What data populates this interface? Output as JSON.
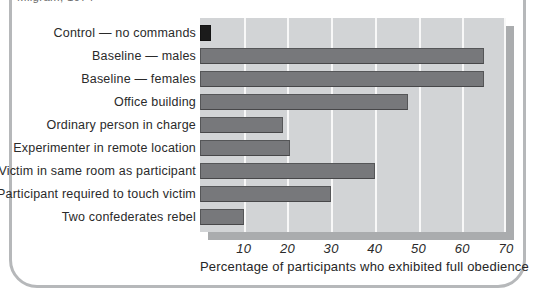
{
  "caption": "Milgram, 1974",
  "colors": {
    "bar_default": "#77787b",
    "bar_control": "#1b1b1b",
    "panel_background": "#d2d4d6",
    "panel_shadow": "#aaacae",
    "gridline": "#fafafa",
    "box_border": "#b6b8ba",
    "text": "#2a2a2a"
  },
  "chart_data": {
    "type": "bar",
    "orientation": "horizontal",
    "title": "",
    "xlabel": "Percentage of participants who exhibited full obedience",
    "ylabel": "",
    "xlim": [
      0,
      70
    ],
    "xticks": [
      10,
      20,
      30,
      40,
      50,
      60,
      70
    ],
    "grid": "vertical white gridlines on gray panel",
    "legend": "none",
    "categories": [
      "Control — no commands",
      "Baseline — males",
      "Baseline — females",
      "Office building",
      "Ordinary person in charge",
      "Experimenter in remote location",
      "Victim in same room as participant",
      "Participant required to touch victim",
      "Two confederates rebel"
    ],
    "values": [
      2.5,
      65,
      65,
      47.5,
      19,
      20.5,
      40,
      30,
      10
    ],
    "bar_colors": [
      "#1b1b1b",
      "#77787b",
      "#77787b",
      "#77787b",
      "#77787b",
      "#77787b",
      "#77787b",
      "#77787b",
      "#77787b"
    ]
  }
}
